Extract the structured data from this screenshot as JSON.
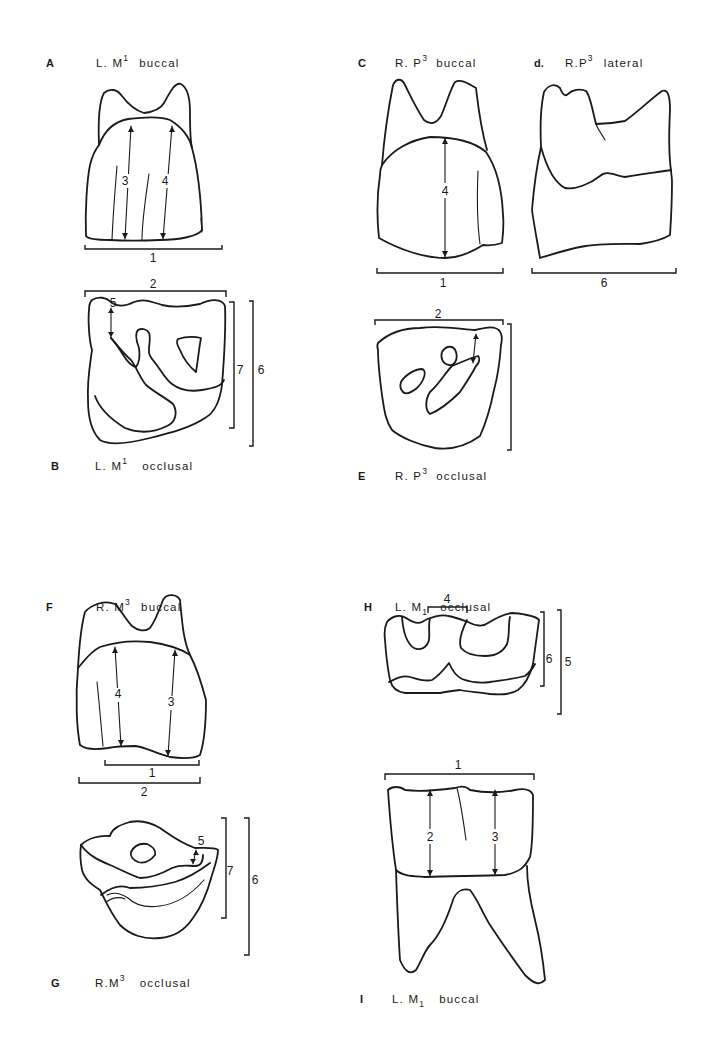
{
  "figure": {
    "panels": [
      {
        "id": "A",
        "letter": "A",
        "tooth": "L.",
        "tooth_base": "M",
        "index": "1",
        "index_pos": "sup",
        "view": "buccal",
        "measurements": [
          "1",
          "3",
          "4"
        ]
      },
      {
        "id": "B",
        "letter": "B",
        "tooth": "L.",
        "tooth_base": "M",
        "index": "1",
        "index_pos": "sup",
        "view": "occlusal",
        "measurements": [
          "2",
          "5",
          "7",
          "6"
        ]
      },
      {
        "id": "C",
        "letter": "C",
        "tooth": "R.",
        "tooth_base": "P",
        "index": "3",
        "index_pos": "sup",
        "view": "buccal",
        "measurements": [
          "4",
          "1"
        ]
      },
      {
        "id": "D",
        "letter": "d.",
        "tooth": "R.",
        "tooth_base": "P",
        "index": "3",
        "index_pos": "sup",
        "view": "lateral",
        "measurements": [
          "6"
        ]
      },
      {
        "id": "E",
        "letter": "E",
        "tooth": "R.",
        "tooth_base": "P",
        "index": "3",
        "index_pos": "sup",
        "view": "occlusal",
        "measurements": [
          "2"
        ]
      },
      {
        "id": "F",
        "letter": "F",
        "tooth": "R.",
        "tooth_base": "M",
        "index": "3",
        "index_pos": "sup",
        "view": "buccal",
        "measurements": [
          "4",
          "3",
          "1",
          "2"
        ]
      },
      {
        "id": "G",
        "letter": "G",
        "tooth": "R.",
        "tooth_base": "M",
        "index": "3",
        "index_pos": "sup",
        "view": "occlusal",
        "measurements": [
          "5",
          "7",
          "6"
        ]
      },
      {
        "id": "H",
        "letter": "H",
        "tooth": "L.",
        "tooth_base": "M",
        "index": "1",
        "index_pos": "sub",
        "view": "occlusal",
        "measurements": [
          "4",
          "6",
          "5"
        ]
      },
      {
        "id": "I",
        "letter": "I",
        "tooth": "L.",
        "tooth_base": "M",
        "index": "1",
        "index_pos": "sub",
        "view": "buccal",
        "measurements": [
          "1",
          "2",
          "3"
        ]
      }
    ]
  }
}
